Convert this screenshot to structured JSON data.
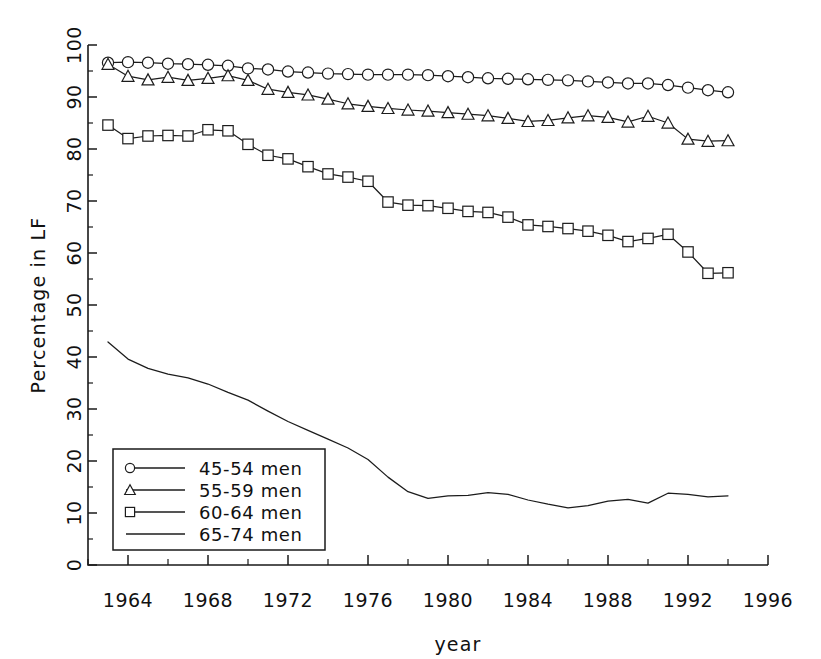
{
  "chart_data": {
    "type": "line",
    "title": "",
    "xlabel": "year",
    "ylabel": "Percentage in LF",
    "xlim": [
      1962,
      1996
    ],
    "ylim": [
      0,
      100
    ],
    "xticks": [
      1964,
      1968,
      1972,
      1976,
      1980,
      1984,
      1988,
      1992,
      1996
    ],
    "xtick_labels": [
      "1964",
      "1968",
      "1972",
      "1976",
      "1980",
      "1984",
      "1988",
      "1992",
      "1996"
    ],
    "xticks_minor": [
      1962,
      1966,
      1970,
      1974,
      1978,
      1982,
      1986,
      1990,
      1994
    ],
    "yticks": [
      0,
      10,
      20,
      30,
      40,
      50,
      60,
      70,
      80,
      90,
      100
    ],
    "ytick_labels": [
      "0",
      "10",
      "20",
      "30",
      "40",
      "50",
      "60",
      "70",
      "80",
      "90",
      "100"
    ],
    "yticks_minor": [
      5,
      15,
      25,
      35,
      45,
      55,
      65,
      75,
      85,
      95
    ],
    "grid": false,
    "legend_position": "lower left",
    "line_color": "#1c1c1c",
    "x": [
      1963,
      1964,
      1965,
      1966,
      1967,
      1968,
      1969,
      1970,
      1971,
      1972,
      1973,
      1974,
      1975,
      1976,
      1977,
      1978,
      1979,
      1980,
      1981,
      1982,
      1983,
      1984,
      1985,
      1986,
      1987,
      1988,
      1989,
      1990,
      1991,
      1992,
      1993,
      1994
    ],
    "series": [
      {
        "name": "45-54 men",
        "marker": "circle",
        "values": [
          96.6,
          96.7,
          96.6,
          96.4,
          96.3,
          96.2,
          96.0,
          95.5,
          95.3,
          94.9,
          94.7,
          94.5,
          94.4,
          94.3,
          94.3,
          94.3,
          94.2,
          94.0,
          93.8,
          93.6,
          93.5,
          93.4,
          93.3,
          93.2,
          93.0,
          92.8,
          92.6,
          92.6,
          92.3,
          91.8,
          91.3,
          90.9
        ]
      },
      {
        "name": "55-59 men",
        "marker": "triangle",
        "values": [
          96.3,
          94.0,
          93.3,
          93.8,
          93.2,
          93.6,
          94.1,
          93.2,
          91.5,
          90.9,
          90.4,
          89.6,
          88.7,
          88.2,
          87.8,
          87.5,
          87.3,
          87.0,
          86.7,
          86.4,
          85.9,
          85.3,
          85.5,
          86.0,
          86.4,
          86.1,
          85.2,
          86.3,
          85.0,
          81.9,
          81.5,
          81.6
        ]
      },
      {
        "name": "60-64 men",
        "marker": "square",
        "values": [
          84.6,
          82.0,
          82.5,
          82.6,
          82.5,
          83.7,
          83.5,
          80.9,
          78.8,
          78.1,
          76.6,
          75.2,
          74.6,
          73.8,
          69.8,
          69.2,
          69.1,
          68.6,
          68.0,
          67.8,
          66.9,
          65.4,
          65.1,
          64.7,
          64.2,
          63.4,
          62.2,
          62.8,
          63.6,
          60.2,
          56.1,
          56.2
        ]
      },
      {
        "name": "65-74 men",
        "marker": "none",
        "values": [
          42.9,
          39.6,
          37.8,
          36.7,
          36.0,
          34.8,
          33.2,
          31.7,
          29.6,
          27.6,
          25.9,
          24.2,
          22.5,
          20.3,
          16.9,
          14.1,
          12.8,
          13.3,
          13.4,
          13.9,
          13.6,
          12.5,
          11.7,
          11.0,
          11.4,
          12.3,
          12.6,
          11.9,
          13.8,
          13.6,
          13.1,
          13.3
        ]
      }
    ]
  },
  "legend": {
    "entries": [
      {
        "label": "45-54 men",
        "marker": "circle"
      },
      {
        "label": "55-59 men",
        "marker": "triangle"
      },
      {
        "label": "60-64 men",
        "marker": "square"
      },
      {
        "label": "65-74 men",
        "marker": "none"
      }
    ]
  }
}
